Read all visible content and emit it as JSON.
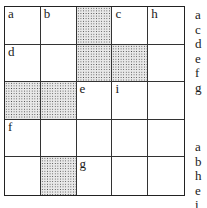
{
  "puzzle": {
    "rows": 5,
    "cols": 5,
    "cells": [
      [
        {
          "label": "a",
          "shaded": false
        },
        {
          "label": "b",
          "shaded": false
        },
        {
          "label": "",
          "shaded": true
        },
        {
          "label": "c",
          "shaded": false
        },
        {
          "label": "h",
          "shaded": false
        }
      ],
      [
        {
          "label": "d",
          "shaded": false
        },
        {
          "label": "",
          "shaded": false
        },
        {
          "label": "",
          "shaded": true
        },
        {
          "label": "",
          "shaded": true
        },
        {
          "label": "",
          "shaded": false
        }
      ],
      [
        {
          "label": "",
          "shaded": true
        },
        {
          "label": "",
          "shaded": true
        },
        {
          "label": "e",
          "shaded": false
        },
        {
          "label": "i",
          "shaded": false
        },
        {
          "label": "",
          "shaded": false
        }
      ],
      [
        {
          "label": "f",
          "shaded": false
        },
        {
          "label": "",
          "shaded": false
        },
        {
          "label": "",
          "shaded": false
        },
        {
          "label": "",
          "shaded": false
        },
        {
          "label": "",
          "shaded": false
        }
      ],
      [
        {
          "label": "",
          "shaded": false
        },
        {
          "label": "",
          "shaded": true
        },
        {
          "label": "g",
          "shaded": false
        },
        {
          "label": "",
          "shaded": false
        },
        {
          "label": "",
          "shaded": false
        }
      ]
    ]
  },
  "clues": {
    "across": [
      "a",
      "c",
      "d",
      "e",
      "f",
      "g"
    ],
    "down": [
      "a",
      "b",
      "h",
      "e",
      "i"
    ]
  }
}
